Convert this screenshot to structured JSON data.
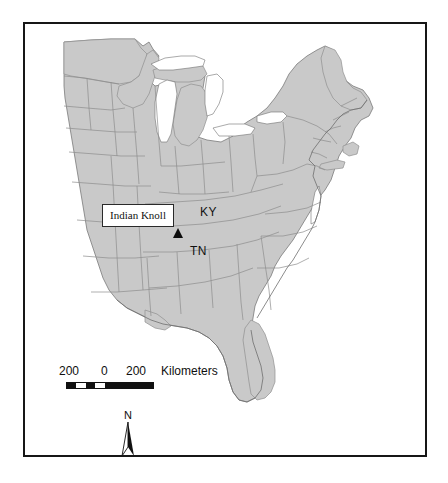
{
  "figure": {
    "kind": "reference-map",
    "region": "Eastern United States",
    "frame_border_color": "#161616",
    "background_color": "#ffffff"
  },
  "map": {
    "land_fill": "#c9c9c9",
    "land_stroke": "#8f8f8f",
    "water_fill": "#ffffff",
    "coast_stroke": "#707070"
  },
  "annotations": {
    "site_label": "Indian Knoll",
    "site_marker_icon": "triangle-marker",
    "state_labels": [
      {
        "id": "ky",
        "text": "KY"
      },
      {
        "id": "tn",
        "text": "TN"
      }
    ]
  },
  "scalebar": {
    "ticks": [
      "200",
      "0",
      "200"
    ],
    "units": "Kilometers",
    "segments": [
      {
        "fill": "#111111"
      },
      {
        "fill": "#ffffff"
      },
      {
        "fill": "#111111"
      },
      {
        "fill": "#ffffff"
      },
      {
        "fill": "#111111"
      }
    ]
  },
  "north_arrow": {
    "label": "N",
    "icon": "north-arrow-icon"
  }
}
